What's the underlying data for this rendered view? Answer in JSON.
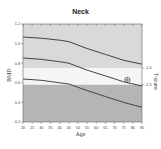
{
  "title": "Neck",
  "colors": {
    "band_upper": "#d9d9d9",
    "band_middle": "#f5f5f5",
    "band_lower": "#b5b5b5",
    "curve": "#444444",
    "axis": "#666666"
  },
  "chart_data": {
    "type": "line",
    "title": "Neck",
    "xlabel": "Age",
    "ylabel": "BMD",
    "y2label": "T-score",
    "xlim": [
      20,
      85
    ],
    "ylim": [
      0.2,
      1.2
    ],
    "x_ticks": [
      20,
      25,
      30,
      35,
      40,
      45,
      50,
      55,
      60,
      65,
      70,
      75,
      80,
      85
    ],
    "y_ticks": [
      0.2,
      0.4,
      0.6,
      0.8,
      1.0,
      1.2
    ],
    "y_tick_labels": [
      "0.2",
      "0.4",
      "0.6",
      "0.8",
      "1.0",
      "1.2"
    ],
    "y2_ticks": [
      {
        "label": "-1.0",
        "bmd": 0.75
      },
      {
        "label": "-2.5",
        "bmd": 0.58
      }
    ],
    "bands": [
      {
        "name": "normal",
        "from": 0.75,
        "to": 1.2,
        "color": "#d9d9d9"
      },
      {
        "name": "osteopenia",
        "from": 0.58,
        "to": 0.75,
        "color": "#f5f5f5"
      },
      {
        "name": "osteoporosis",
        "from": 0.2,
        "to": 0.58,
        "color": "#b5b5b5"
      }
    ],
    "x": [
      20,
      30,
      40,
      45,
      55,
      65,
      75,
      85
    ],
    "series": [
      {
        "name": "+1 SD",
        "values": [
          1.067,
          1.055,
          1.035,
          1.02,
          0.95,
          0.89,
          0.83,
          0.79
        ]
      },
      {
        "name": "Mean",
        "values": [
          0.853,
          0.84,
          0.815,
          0.8,
          0.73,
          0.67,
          0.61,
          0.567
        ]
      },
      {
        "name": "-1 SD",
        "values": [
          0.639,
          0.625,
          0.6,
          0.588,
          0.52,
          0.46,
          0.4,
          0.35
        ]
      }
    ],
    "patient_point": {
      "age": 77,
      "bmd": 0.63,
      "marker": "circle-crosshair"
    },
    "grid": false,
    "legend": "none"
  }
}
